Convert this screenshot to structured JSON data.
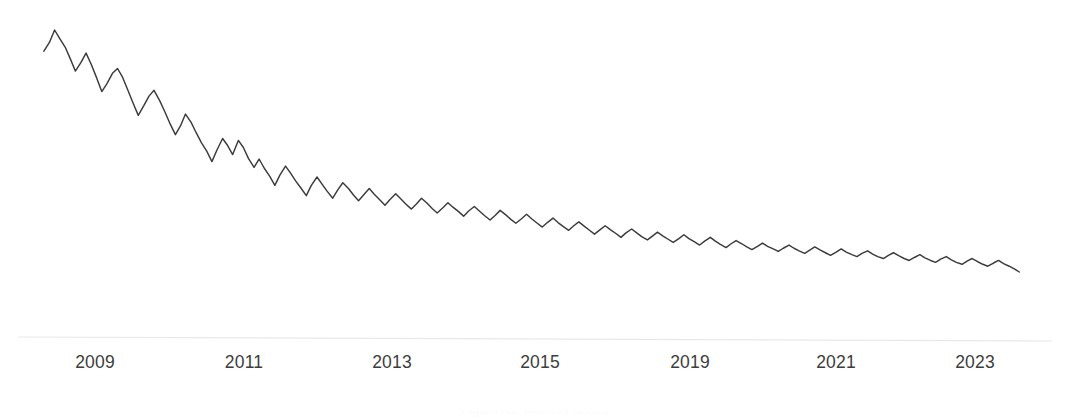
{
  "figure": {
    "background_color": "#ffffff",
    "width": 1069,
    "height": 417,
    "caption_fragment": "Figure A1. Monthly series"
  },
  "axis": {
    "line_color": "#e8e8e8",
    "x_start_px": 18,
    "x_end_px": 1052,
    "y_left_px": 337,
    "y_right_px": 341
  },
  "chart_data": {
    "type": "line",
    "title": "",
    "subtitle": "",
    "xlabel": "",
    "ylabel": "",
    "grid": false,
    "legend": null,
    "series_color": "#3b3b3b",
    "xlim": [
      2008.3,
      2024.0
    ],
    "ylim": [
      0,
      100
    ],
    "axis_ticks": {
      "x_tick_labels": [
        "2009",
        "2011",
        "2013",
        "2015",
        "2019",
        "2021",
        "2023"
      ],
      "x_tick_px": [
        95,
        244,
        392,
        540,
        690,
        836,
        975
      ],
      "y_tick_labels": []
    },
    "note": "Tick labels are evenly spaced but skip 2017; spacing between printed labels is uniform.",
    "x": [
      2008.33,
      2008.42,
      2008.5,
      2008.58,
      2008.67,
      2008.75,
      2008.83,
      2008.92,
      2009.0,
      2009.08,
      2009.17,
      2009.25,
      2009.33,
      2009.42,
      2009.5,
      2009.58,
      2009.67,
      2009.75,
      2009.83,
      2009.92,
      2010.0,
      2010.08,
      2010.17,
      2010.25,
      2010.33,
      2010.42,
      2010.5,
      2010.58,
      2010.67,
      2010.75,
      2010.83,
      2010.92,
      2011.0,
      2011.08,
      2011.17,
      2011.25,
      2011.33,
      2011.42,
      2011.5,
      2011.58,
      2011.67,
      2011.75,
      2011.83,
      2011.92,
      2012.0,
      2012.08,
      2012.17,
      2012.25,
      2012.33,
      2012.42,
      2012.5,
      2012.58,
      2012.67,
      2012.75,
      2012.83,
      2012.92,
      2013.0,
      2013.08,
      2013.17,
      2013.25,
      2013.33,
      2013.42,
      2013.5,
      2013.58,
      2013.67,
      2013.75,
      2013.83,
      2013.92,
      2014.0,
      2014.08,
      2014.17,
      2014.25,
      2014.33,
      2014.42,
      2014.5,
      2014.58,
      2014.67,
      2014.75,
      2014.83,
      2014.92,
      2015.0,
      2015.08,
      2015.17,
      2015.25,
      2015.33,
      2015.42,
      2015.5,
      2015.58,
      2015.67,
      2015.75,
      2015.83,
      2015.92,
      2016.0,
      2016.08,
      2016.17,
      2016.25,
      2016.33,
      2016.42,
      2016.5,
      2016.58,
      2016.67,
      2016.75,
      2016.83,
      2016.92,
      2017.0,
      2017.08,
      2017.17,
      2017.25,
      2017.33,
      2017.42,
      2017.5,
      2017.58,
      2017.67,
      2017.75,
      2017.83,
      2017.92,
      2018.0,
      2018.08,
      2018.17,
      2018.25,
      2018.33,
      2018.42,
      2018.5,
      2018.58,
      2018.67,
      2018.75,
      2018.83,
      2018.92,
      2019.0,
      2019.08,
      2019.17,
      2019.25,
      2019.33,
      2019.42,
      2019.5,
      2019.58,
      2019.67,
      2019.75,
      2019.83,
      2019.92,
      2020.0,
      2020.08,
      2020.17,
      2020.25,
      2020.33,
      2020.42,
      2020.5,
      2020.58,
      2020.67,
      2020.75,
      2020.83,
      2020.92,
      2021.0,
      2021.08,
      2021.17,
      2021.25,
      2021.33,
      2021.42,
      2021.5,
      2021.58,
      2021.67,
      2021.75,
      2021.83,
      2021.92,
      2022.0,
      2022.08,
      2022.17,
      2022.25,
      2022.33,
      2022.42,
      2022.5,
      2022.58,
      2022.67,
      2022.75,
      2022.83,
      2022.92,
      2023.0,
      2023.08,
      2023.17,
      2023.25,
      2023.33,
      2023.42,
      2023.5,
      2023.58,
      2023.67,
      2023.75,
      2023.83
    ],
    "y": [
      86.4,
      89.2,
      93.0,
      90.4,
      87.6,
      84.0,
      80.2,
      82.9,
      85.8,
      82.4,
      78.0,
      73.8,
      76.2,
      79.5,
      81.0,
      78.3,
      74.0,
      70.1,
      66.4,
      69.5,
      72.4,
      74.2,
      71.0,
      67.6,
      64.0,
      60.4,
      63.1,
      66.8,
      64.2,
      61.0,
      58.0,
      55.2,
      52.0,
      55.6,
      59.2,
      57.0,
      54.2,
      58.6,
      56.4,
      53.0,
      50.2,
      52.8,
      50.0,
      47.4,
      44.6,
      47.8,
      50.6,
      48.4,
      46.0,
      43.6,
      41.4,
      44.6,
      47.2,
      45.0,
      42.8,
      40.6,
      43.2,
      45.4,
      43.6,
      41.6,
      39.8,
      41.8,
      43.6,
      41.8,
      40.0,
      38.4,
      40.2,
      42.0,
      40.4,
      38.8,
      37.2,
      38.8,
      40.6,
      39.0,
      37.4,
      36.0,
      37.6,
      39.2,
      37.8,
      36.4,
      35.0,
      36.6,
      38.0,
      36.6,
      35.2,
      33.8,
      35.2,
      36.8,
      35.4,
      34.0,
      32.8,
      34.2,
      35.6,
      34.2,
      32.8,
      31.6,
      33.0,
      34.4,
      33.0,
      31.8,
      30.6,
      32.0,
      33.2,
      31.8,
      30.6,
      29.4,
      30.8,
      32.0,
      30.8,
      29.6,
      28.4,
      29.8,
      31.0,
      29.8,
      28.6,
      27.6,
      28.8,
      30.0,
      28.8,
      27.8,
      26.8,
      28.0,
      29.2,
      28.0,
      27.0,
      26.0,
      27.2,
      28.4,
      27.2,
      26.2,
      25.2,
      26.4,
      27.4,
      26.4,
      25.4,
      24.6,
      25.6,
      26.6,
      25.6,
      24.8,
      24.0,
      25.0,
      26.0,
      25.0,
      24.2,
      23.4,
      24.4,
      25.4,
      24.4,
      23.6,
      22.8,
      23.8,
      24.8,
      23.8,
      23.0,
      22.4,
      23.4,
      24.2,
      23.2,
      22.4,
      21.8,
      22.8,
      23.6,
      22.6,
      21.8,
      21.2,
      22.2,
      23.0,
      22.0,
      21.2,
      20.6,
      21.6,
      22.4,
      21.4,
      20.6,
      20.0,
      21.0,
      21.8,
      20.8,
      20.0,
      19.4,
      20.4,
      21.2,
      20.2,
      19.4,
      18.6,
      17.6
    ]
  }
}
